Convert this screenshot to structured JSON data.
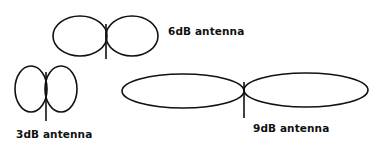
{
  "diagram": {
    "title": "",
    "stroke_color": "#111111",
    "antennas": [
      {
        "id": "6db",
        "label": "6dB antenna"
      },
      {
        "id": "3db",
        "label": "3dB antenna"
      },
      {
        "id": "9db",
        "label": "9dB antenna"
      }
    ]
  }
}
